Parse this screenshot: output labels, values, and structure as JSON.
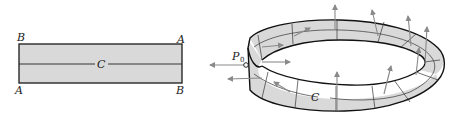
{
  "figure": {
    "left_panel": {
      "description": "Flat rectangle (strip before twisting)",
      "corner_labels": {
        "top_left": "B",
        "top_right": "A",
        "bottom_left": "A",
        "bottom_right": "B"
      },
      "center_line_label": "C",
      "fill_color": "#d9d9d9",
      "stroke_color": "#1a1a1a"
    },
    "right_panel": {
      "description": "Möbius strip with normal vectors along center curve",
      "point_label": "P",
      "point_subscript": "0",
      "curve_label": "C",
      "fill_color": "#d9d9d9",
      "arrow_color": "#8a8a8a",
      "normal_vector_count": 11
    }
  }
}
